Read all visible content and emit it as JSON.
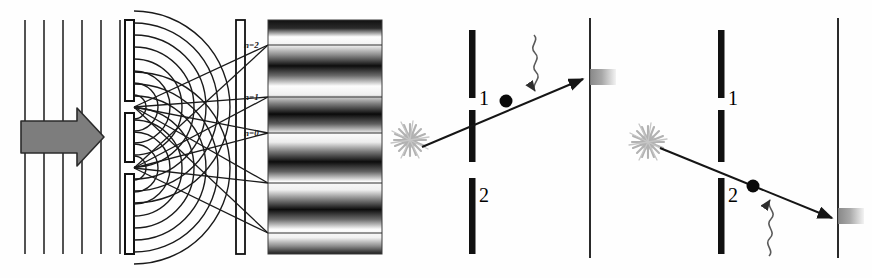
{
  "figure": {
    "background_color": "#fefefe",
    "ink_color": "#1a1a1a",
    "arrow_fill": "#7d7d7d",
    "arrow_stroke": "#2b2b2b",
    "source_color": "#b0b0b0",
    "detector_spot_color": "#9a9a9a",
    "caption_text": ""
  },
  "panels": [
    {
      "id": "panel-wave",
      "name": "wave-interference-panel",
      "description": "Plane waves pass a double slit, produce circular wavefronts and an interference fringe pattern",
      "incoming_wavefront_count": 6,
      "order_labels": [
        {
          "text": "n=2",
          "x": 242,
          "y": 48
        },
        {
          "text": "n=1",
          "x": 242,
          "y": 100
        },
        {
          "text": "n=0",
          "x": 242,
          "y": 136
        }
      ],
      "fringe": {
        "type": "interference-pattern",
        "bands": 7,
        "orientation": "horizontal"
      }
    },
    {
      "id": "panel-slit1",
      "name": "which-path-slit-1-panel",
      "description": "Particle detected going through slit 1, photon probe scattering",
      "slit_labels": [
        "1",
        "2"
      ],
      "path_through_slit": "1",
      "path_direction": "upward",
      "photon_probe": "wavy-arrow",
      "source": "starburst",
      "detector": "screen-with-spot"
    },
    {
      "id": "panel-slit2",
      "name": "which-path-slit-2-panel",
      "description": "Particle detected going through slit 2, photon probe scattering",
      "slit_labels": [
        "1",
        "2"
      ],
      "path_through_slit": "2",
      "path_direction": "downward",
      "photon_probe": "wavy-arrow",
      "source": "starburst",
      "detector": "screen-with-spot"
    }
  ]
}
